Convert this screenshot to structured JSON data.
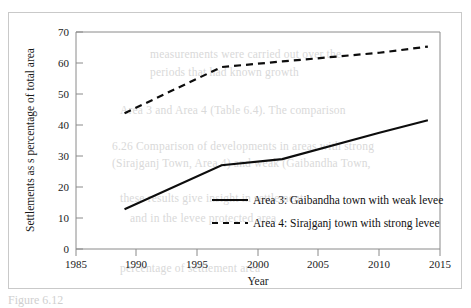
{
  "figure": {
    "background_color": "#ffffff",
    "frame_color": "#c9c9c9",
    "caption_stub": "Figure 6.12"
  },
  "chart_data": {
    "type": "line",
    "title": "",
    "xlabel": "Year",
    "ylabel": "Settlements as s percentage of total area",
    "xlim": [
      1985,
      2015
    ],
    "ylim": [
      0,
      70
    ],
    "xticks": [
      1985,
      1990,
      1995,
      2000,
      2005,
      2010,
      2015
    ],
    "yticks": [
      0,
      10,
      20,
      30,
      40,
      50,
      60,
      70
    ],
    "grid": false,
    "legend_position": "inside-lower-right",
    "series": [
      {
        "name": "Area 3: Gaibandha town with weak levee",
        "style": "solid",
        "color": "#0d0d0d",
        "x": [
          1989,
          1997,
          2002,
          2010,
          2014
        ],
        "values": [
          12.8,
          27.0,
          29.0,
          37.5,
          41.5
        ]
      },
      {
        "name": "Area 4: Sirajganj town with strong levee",
        "style": "dashed",
        "color": "#0d0d0d",
        "x": [
          1989,
          1997,
          2002,
          2010,
          2014
        ],
        "values": [
          43.8,
          58.7,
          60.5,
          63.3,
          65.3
        ]
      }
    ]
  },
  "legend": {
    "entries": [
      {
        "label": "Area 3: Gaibandha town with weak levee",
        "style": "solid"
      },
      {
        "label": "Area 4: Sirajganj town with strong levee",
        "style": "dashed"
      }
    ]
  },
  "bleed_text": [
    {
      "text": "measurements were carried out over the",
      "x": 150,
      "y": 48
    },
    {
      "text": "periods that had known growth",
      "x": 150,
      "y": 66
    },
    {
      "text": "Area 3 and Area 4 (Table 6.4). The comparison",
      "x": 120,
      "y": 104
    },
    {
      "text": "6.26 Comparison of developments in areas with strong",
      "x": 112,
      "y": 140
    },
    {
      "text": "(Sirajganj Town, Area 4) and weak (Gaibandha Town,",
      "x": 112,
      "y": 157
    },
    {
      "text": "these results give insight in settlement",
      "x": 120,
      "y": 192
    },
    {
      "text": "and in the levee protected area",
      "x": 130,
      "y": 212
    },
    {
      "text": "percentage of settlement area",
      "x": 120,
      "y": 262
    }
  ]
}
